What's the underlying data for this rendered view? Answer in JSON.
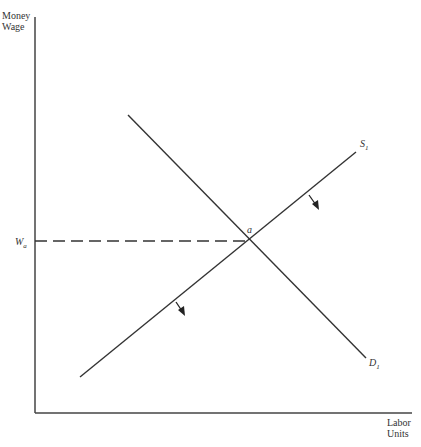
{
  "diagram": {
    "type": "labor-market supply-demand",
    "y_axis_label": [
      "Money",
      "Wage"
    ],
    "x_axis_label": [
      "Labor",
      "Units"
    ],
    "wage_label": {
      "main": "W",
      "sub": "a"
    },
    "equilibrium_label": "a",
    "supply_label": {
      "main": "S",
      "sub": "1"
    },
    "demand_label": {
      "main": "D",
      "sub": "1"
    },
    "shift_arrows": [
      "supply-shift-down-right",
      "supply-shift-down-right"
    ],
    "colors": {
      "line": "#333333",
      "axis": "#444444"
    }
  }
}
